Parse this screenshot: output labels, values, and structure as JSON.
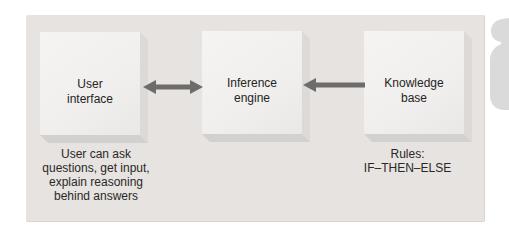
{
  "diagram": {
    "title_hidden": "",
    "type": "block-diagram"
  },
  "boxes": [
    {
      "id": "user-interface",
      "label": "User\ninterface"
    },
    {
      "id": "inference-engine",
      "label": "Inference\nengine"
    },
    {
      "id": "knowledge-base",
      "label": "Knowledge\nbase"
    }
  ],
  "captions": [
    {
      "for": "user-interface",
      "text": "User can ask\nquestions, get input,\nexplain reasoning\nbehind answers"
    },
    {
      "for": "knowledge-base",
      "text": "Rules:\nIF–THEN–ELSE"
    }
  ],
  "arrows": [
    {
      "between": [
        "user-interface",
        "inference-engine"
      ],
      "direction": "bidirectional"
    },
    {
      "between": [
        "knowledge-base",
        "inference-engine"
      ],
      "direction": "left"
    }
  ],
  "colors": {
    "panel_background": "#e6e3e1",
    "box_face": "#f1efed",
    "box_side_right": "#dcd9d7",
    "box_side_bottom": "#d3d0ce",
    "arrow": "#6e6c6b",
    "text": "#2a2827",
    "corner_graphic": "#dadada"
  }
}
